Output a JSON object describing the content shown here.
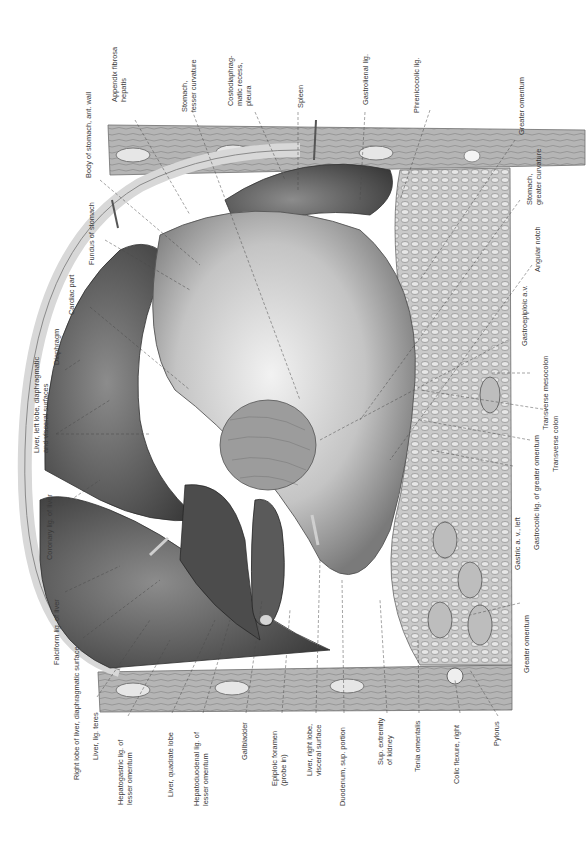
{
  "figure": {
    "orientation": "rotated 90° counter-clockwise",
    "colors": {
      "background": "#ffffff",
      "ink": "#3a3a3a",
      "leader": "#4a4a4a",
      "tissue_light": "#d9d9d9",
      "tissue_mid": "#9a9a9a",
      "tissue_dark": "#3c3c3c"
    }
  },
  "labels": {
    "left": [
      {
        "id": "falciform",
        "text": "Falciform lig. of liver"
      },
      {
        "id": "right-lobe",
        "text": "Right lobe of liver, diaphragmatic surface"
      },
      {
        "id": "lig-teres",
        "text": "Liver, lig. teres"
      },
      {
        "id": "hepatogastric",
        "text": "Hepatogastric lig. of\nlesser omentum"
      },
      {
        "id": "quadrate",
        "text": "Liver, quadrate lobe"
      },
      {
        "id": "hepatoduodenal",
        "text": "Hepatoduodenal lig. of\nlesser omentum"
      },
      {
        "id": "gallbladder",
        "text": "Gallbladder"
      },
      {
        "id": "epiploic",
        "text": "Epiploic foramen\n(probe in)"
      },
      {
        "id": "right-lobe-visceral",
        "text": "Liver, right lobe,\nvisceral surface"
      },
      {
        "id": "duodenum",
        "text": "Duodenum, sup. portion"
      },
      {
        "id": "kidney",
        "text": "Sup. extremity\nof kidney"
      },
      {
        "id": "tenia",
        "text": "Tenia omentalis"
      },
      {
        "id": "colic-flexure",
        "text": "Colic flexure, right"
      },
      {
        "id": "pylorus",
        "text": "Pylorus"
      }
    ],
    "upper_left": [
      {
        "id": "coronary",
        "text": "Coronary lig. of liver"
      },
      {
        "id": "left-lobe",
        "text": "Liver, left lobe, diaphragmatic\nand visceral surfaces"
      },
      {
        "id": "diaphragm",
        "text": "Diaphragm"
      },
      {
        "id": "cardiac",
        "text": "Cardiac part"
      },
      {
        "id": "fundus",
        "text": "Fundus of stomach"
      },
      {
        "id": "body-stomach",
        "text": "Body of stomach, ant. wall"
      }
    ],
    "top": [
      {
        "id": "appendix-fibrosa",
        "text": "Appendix fibrosa\nhepatis"
      },
      {
        "id": "lesser-curvature",
        "text": "Stomach,\nlesser curvature"
      },
      {
        "id": "costodiaphragmatic",
        "text": "Costodiaphrag-\nmatic recess,\npleura"
      },
      {
        "id": "spleen",
        "text": "Spleen"
      },
      {
        "id": "gastrolienal",
        "text": "Gastrolienal lig."
      },
      {
        "id": "phrenicocolic",
        "text": "Phrenicocolic lig."
      }
    ],
    "right": [
      {
        "id": "greater-omentum-top",
        "text": "Greater omentum"
      },
      {
        "id": "greater-curvature",
        "text": "Stomach,\ngreater curvature"
      },
      {
        "id": "angular-notch",
        "text": "Angular notch"
      },
      {
        "id": "gastroepiploic",
        "text": "Gastroepiploic a.v."
      },
      {
        "id": "transverse-mesocolon",
        "text": "Transverse mesocolon"
      },
      {
        "id": "transverse-colon",
        "text": "Transverse colon"
      },
      {
        "id": "gastrocolic",
        "text": "Gastrocolic lig. of greater omentum"
      },
      {
        "id": "gastric-av",
        "text": "Gastric a. v., left"
      },
      {
        "id": "greater-omentum-bottom",
        "text": "Greater omentum"
      }
    ]
  }
}
